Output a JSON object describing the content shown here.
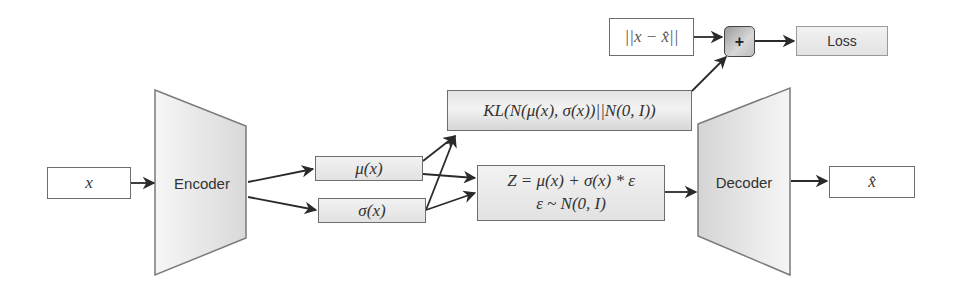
{
  "diagram": {
    "nodes": {
      "input": {
        "label": "x"
      },
      "encoder": {
        "label": "Encoder"
      },
      "mu": {
        "label": "μ(x)"
      },
      "sigma": {
        "label": "σ(x)"
      },
      "kl": {
        "label": "KL(N(μ(x), σ(x))||N(0, I))"
      },
      "z": {
        "line1": "Z = μ(x) + σ(x) * ε",
        "line2": "ε ~ N(0, I)"
      },
      "decoder": {
        "label": "Decoder"
      },
      "output": {
        "label": "x̂"
      },
      "recon": {
        "label": "||x − x̂||"
      },
      "sum": {
        "label": "+"
      },
      "loss": {
        "label": "Loss"
      }
    },
    "edges": [
      {
        "from": "input",
        "to": "encoder"
      },
      {
        "from": "encoder",
        "to": "mu"
      },
      {
        "from": "encoder",
        "to": "sigma"
      },
      {
        "from": "mu",
        "to": "kl"
      },
      {
        "from": "sigma",
        "to": "kl"
      },
      {
        "from": "mu",
        "to": "z"
      },
      {
        "from": "sigma",
        "to": "z"
      },
      {
        "from": "z",
        "to": "decoder"
      },
      {
        "from": "decoder",
        "to": "output"
      },
      {
        "from": "recon",
        "to": "sum"
      },
      {
        "from": "kl",
        "to": "sum"
      },
      {
        "from": "sum",
        "to": "loss"
      }
    ],
    "colors": {
      "stroke": "#6e6e6e",
      "arrow": "#2a2a2a",
      "fill_light": "#f2f2f2",
      "fill_dark": "#c8c8c8",
      "text": "#333333"
    }
  }
}
